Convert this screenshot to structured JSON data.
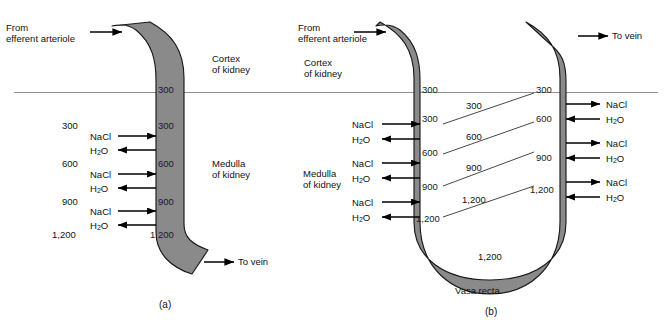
{
  "figure": {
    "vessel_fill": "#8a8a8a",
    "vessel_stroke": "#1a1a1a",
    "boundary_line_color": "#888888",
    "background": "#ffffff"
  },
  "boundary": {
    "label": "cortex-medulla-boundary"
  },
  "panel_a": {
    "caption": "(a)",
    "inlet_label_line1": "From",
    "inlet_label_line2": "efferent arteriole",
    "outlet_label": "To vein",
    "cortex_line1": "Cortex",
    "cortex_line2": "of kidney",
    "medulla_line1": "Medulla",
    "medulla_line2": "of kidney",
    "interstitial_values": [
      "300",
      "600",
      "900",
      "1,200"
    ],
    "vessel_values": [
      "300",
      "300",
      "600",
      "900",
      "1,200"
    ],
    "exchange_pairs": [
      {
        "solute": "NaCl",
        "water": "H2O"
      },
      {
        "solute": "NaCl",
        "water": "H2O"
      },
      {
        "solute": "NaCl",
        "water": "H2O"
      }
    ],
    "solute_label": "NaCl",
    "water_label_main": "H",
    "water_label_sub": "2",
    "water_label_tail": "O"
  },
  "panel_b": {
    "caption": "(b)",
    "inlet_label_line1": "From",
    "inlet_label_line2": "efferent arteriole",
    "outlet_label": "To vein",
    "cortex_line1": "Cortex",
    "cortex_line2": "of kidney",
    "medulla_line1": "Medulla",
    "medulla_line2": "of kidney",
    "vasa_recta_label": "Vasa recta",
    "descending_values": [
      "300",
      "300",
      "600",
      "900",
      "1,200"
    ],
    "ascending_values": [
      "300",
      "600",
      "900",
      "1,200"
    ],
    "interstitial_values": [
      "300",
      "600",
      "900",
      "1,200"
    ],
    "bottom_value": "1,200",
    "loop_bottom_value": "1,200",
    "left_exchange_pairs": [
      {
        "solute": "NaCl",
        "water": "H2O"
      },
      {
        "solute": "NaCl",
        "water": "H2O"
      },
      {
        "solute": "NaCl",
        "water": "H2O"
      }
    ],
    "right_exchange_pairs": [
      {
        "solute": "NaCl",
        "water": "H2O"
      },
      {
        "solute": "NaCl",
        "water": "H2O"
      },
      {
        "solute": "NaCl",
        "water": "H2O"
      }
    ],
    "solute_label": "NaCl",
    "water_label_main": "H",
    "water_label_sub": "2",
    "water_label_tail": "O"
  }
}
